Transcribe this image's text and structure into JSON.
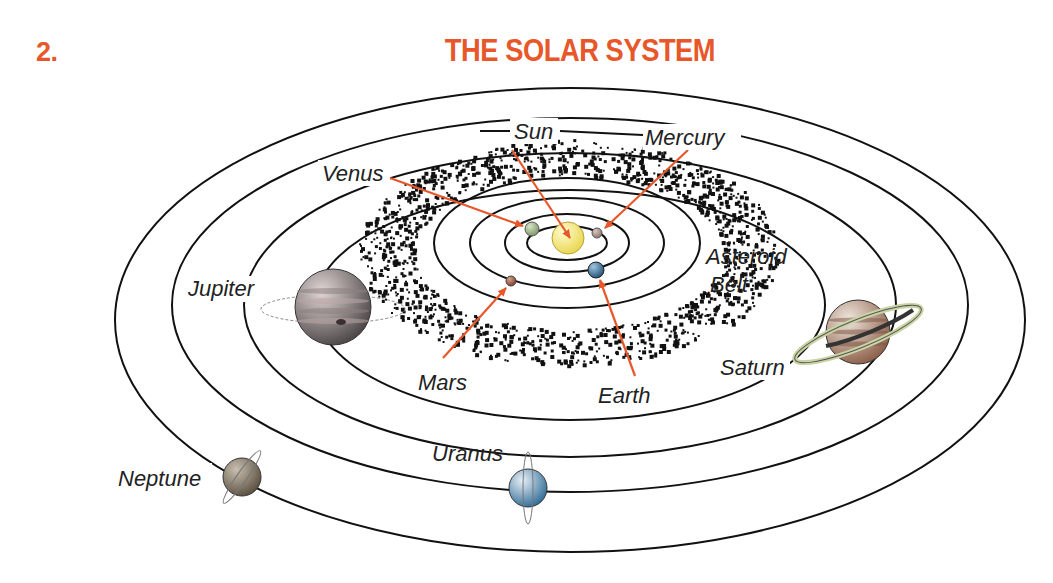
{
  "figure": {
    "number": "2.",
    "title": "THE SOLAR SYSTEM"
  },
  "colors": {
    "heading": "#e8572a",
    "arrow": "#e8572a",
    "orbit": "#111111",
    "asteroid": "#111111",
    "label": "#222222"
  },
  "center": {
    "x": 570,
    "y": 310
  },
  "orbits": [
    {
      "name": "mercury-orbit",
      "rx": 40,
      "ry": 17
    },
    {
      "name": "venus-orbit",
      "rx": 62,
      "ry": 29
    },
    {
      "name": "earth-orbit",
      "rx": 97,
      "ry": 45
    },
    {
      "name": "mars-orbit",
      "rx": 133,
      "ry": 65
    },
    {
      "name": "jupiter-orbit",
      "rx": 255,
      "ry": 115
    },
    {
      "name": "saturn-orbit",
      "rx": 326,
      "ry": 152
    },
    {
      "name": "uranus-orbit",
      "rx": 398,
      "ry": 187
    },
    {
      "name": "neptune-orbit",
      "rx": 455,
      "ry": 232
    }
  ],
  "asteroid_belt": {
    "label_line1": "Asteroid",
    "label_line2": "Belt",
    "inner_rx": 155,
    "inner_ry": 77,
    "outer_rx": 210,
    "outer_ry": 113
  },
  "bodies": [
    {
      "name": "Sun",
      "x": 568,
      "y": 238,
      "r": 16,
      "fill_light": "#fffbd0",
      "fill_dark": "#e8d64a",
      "stroke": "#b5a23a"
    },
    {
      "name": "Mercury",
      "x": 597,
      "y": 233,
      "r": 5,
      "fill_light": "#d8c8c0",
      "fill_dark": "#8a7266",
      "stroke": "#555"
    },
    {
      "name": "Venus",
      "x": 532,
      "y": 229,
      "r": 7,
      "fill_light": "#d6e4c6",
      "fill_dark": "#7c9465",
      "stroke": "#555"
    },
    {
      "name": "Earth",
      "x": 596,
      "y": 270,
      "r": 8,
      "fill_light": "#9ec7e0",
      "fill_dark": "#1f4f72",
      "stroke": "#222"
    },
    {
      "name": "Mars",
      "x": 511,
      "y": 281,
      "r": 5,
      "fill_light": "#d7a38a",
      "fill_dark": "#7a3d2b",
      "stroke": "#444"
    },
    {
      "name": "Jupiter",
      "x": 333,
      "y": 307,
      "r": 38,
      "fill_light": "#e2d6d6",
      "fill_dark": "#4a4444",
      "stroke": "#333"
    },
    {
      "name": "Saturn",
      "x": 858,
      "y": 332,
      "r": 32,
      "fill_light": "#efe6dd",
      "fill_dark": "#8b5e48",
      "stroke": "#333"
    },
    {
      "name": "Uranus",
      "x": 528,
      "y": 488,
      "r": 19,
      "fill_light": "#e8eff5",
      "fill_dark": "#2e6b97",
      "stroke": "#333"
    },
    {
      "name": "Neptune",
      "x": 242,
      "y": 477,
      "r": 19,
      "fill_light": "#c8bfb0",
      "fill_dark": "#5a4e3e",
      "stroke": "#333"
    }
  ],
  "labels": {
    "sun": "Sun",
    "mercury": "Mercury",
    "venus": "Venus",
    "earth": "Earth",
    "mars": "Mars",
    "jupiter": "Jupiter",
    "saturn": "Saturn",
    "uranus": "Uranus",
    "neptune": "Neptune"
  }
}
